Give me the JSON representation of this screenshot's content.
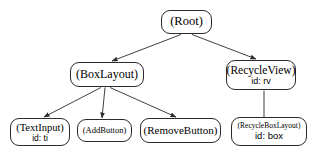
{
  "diagram": {
    "background_color": "#ffffff",
    "stroke_color": "#2b2b2b",
    "text_color": "#000000",
    "nodes": [
      {
        "key": "root",
        "class_label": "(Root)",
        "id_label": ""
      },
      {
        "key": "boxlayout",
        "class_label": "(BoxLayout)",
        "id_label": ""
      },
      {
        "key": "recycleview",
        "class_label": "(RecycleView)",
        "id_label": "id: rv"
      },
      {
        "key": "textinput",
        "class_label": "(TextInput)",
        "id_label": "id: ti"
      },
      {
        "key": "addbutton",
        "class_label": "(AddButton)",
        "id_label": ""
      },
      {
        "key": "removebutton",
        "class_label": "(RemoveButton)",
        "id_label": ""
      },
      {
        "key": "recycleboxlayout",
        "class_label": "(RecycleBoxLayout)",
        "id_label": "id: box"
      }
    ],
    "edges": [
      {
        "from": "root",
        "to": "boxlayout",
        "arrow": true
      },
      {
        "from": "root",
        "to": "recycleview",
        "arrow": true
      },
      {
        "from": "boxlayout",
        "to": "textinput",
        "arrow": true
      },
      {
        "from": "boxlayout",
        "to": "addbutton",
        "arrow": true
      },
      {
        "from": "boxlayout",
        "to": "removebutton",
        "arrow": true
      },
      {
        "from": "recycleview",
        "to": "recycleboxlayout",
        "arrow": false
      }
    ]
  }
}
